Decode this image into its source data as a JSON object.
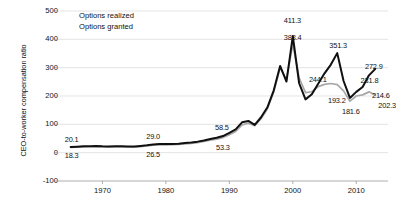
{
  "chart_data": {
    "type": "line",
    "title": "",
    "xlabel": "",
    "ylabel": "CEO-to-worker compensation ratio",
    "xlim": [
      1963,
      2015
    ],
    "ylim": [
      -100,
      500
    ],
    "ytick_labels": [
      "500",
      "400",
      "300",
      "200",
      "100",
      "0",
      "-100"
    ],
    "ytick_values": [
      500,
      400,
      300,
      200,
      100,
      0,
      -100
    ],
    "xtick_labels": [
      "1970",
      "1980",
      "1990",
      "2000",
      "2010"
    ],
    "xtick_values": [
      1970,
      1980,
      1990,
      2000,
      2010
    ],
    "grid": true,
    "legend_position": "top-left",
    "series": [
      {
        "name": "Options realized",
        "color": "#101010",
        "x": [
          1965,
          1966,
          1967,
          1968,
          1969,
          1970,
          1971,
          1972,
          1973,
          1974,
          1975,
          1976,
          1977,
          1978,
          1979,
          1980,
          1981,
          1982,
          1983,
          1984,
          1985,
          1986,
          1987,
          1988,
          1989,
          1990,
          1991,
          1992,
          1993,
          1994,
          1995,
          1996,
          1997,
          1998,
          1999,
          2000,
          2001,
          2002,
          2003,
          2004,
          2005,
          2006,
          2007,
          2008,
          2009,
          2010,
          2011,
          2012,
          2013
        ],
        "values": [
          20.1,
          21.2,
          22.4,
          23.0,
          23.6,
          22.5,
          22.1,
          22.4,
          22.9,
          22.1,
          21.6,
          23.8,
          26.1,
          29.0,
          30.8,
          30.2,
          30.8,
          31.5,
          33.8,
          36.1,
          38.9,
          43.2,
          48.4,
          52.5,
          58.5,
          69.8,
          82.0,
          107.0,
          112.0,
          98.0,
          125.0,
          160.0,
          220.0,
          306.0,
          251.0,
          411.3,
          245.0,
          188.0,
          206.0,
          243.0,
          280.0,
          311.0,
          351.3,
          253.0,
          193.2,
          214.6,
          231.8,
          272.9,
          295.9
        ],
        "labeled_points": [
          {
            "x": 1965,
            "y": 20.1,
            "label": "20.1"
          },
          {
            "x": 1978,
            "y": 29.0,
            "label": "29.0"
          },
          {
            "x": 1989,
            "y": 58.5,
            "label": "58.5"
          },
          {
            "x": 2000,
            "y": 411.3,
            "label": "411.3"
          },
          {
            "x": 2007,
            "y": 351.3,
            "label": "351.3"
          },
          {
            "x": 2009,
            "y": 193.2,
            "label": "193.2"
          },
          {
            "x": 2011,
            "y": 231.8,
            "label": "231.8"
          },
          {
            "x": 2012,
            "y": 272.9,
            "label": "272.9"
          }
        ]
      },
      {
        "name": "Options granted",
        "color": "#a8a8a8",
        "x": [
          1965,
          1966,
          1967,
          1968,
          1969,
          1970,
          1971,
          1972,
          1973,
          1974,
          1975,
          1976,
          1977,
          1978,
          1979,
          1980,
          1981,
          1982,
          1983,
          1984,
          1985,
          1986,
          1987,
          1988,
          1989,
          1990,
          1991,
          1992,
          1993,
          1994,
          1995,
          1996,
          1997,
          1998,
          1999,
          2000,
          2001,
          2002,
          2003,
          2004,
          2005,
          2006,
          2007,
          2008,
          2009,
          2010,
          2011,
          2012,
          2013
        ],
        "values": [
          18.3,
          19.2,
          20.2,
          20.8,
          21.3,
          20.4,
          20.0,
          20.3,
          20.7,
          20.0,
          19.6,
          21.6,
          23.7,
          26.5,
          28.1,
          27.6,
          28.2,
          28.8,
          30.9,
          33.0,
          35.6,
          39.5,
          44.2,
          48.0,
          53.3,
          63.7,
          75.0,
          98.0,
          104.0,
          95.0,
          120.0,
          155.0,
          215.0,
          300.0,
          258.0,
          383.4,
          264.0,
          212.0,
          215.0,
          233.0,
          241.0,
          244.1,
          240.0,
          218.0,
          181.6,
          200.0,
          204.0,
          214.6,
          202.3
        ],
        "labeled_points": [
          {
            "x": 1965,
            "y": 18.3,
            "label": "18.3"
          },
          {
            "x": 1978,
            "y": 26.5,
            "label": "26.5"
          },
          {
            "x": 1989,
            "y": 53.3,
            "label": "53.3"
          },
          {
            "x": 2000,
            "y": 383.4,
            "label": "383.4"
          },
          {
            "x": 2006,
            "y": 244.1,
            "label": "244.1"
          },
          {
            "x": 2009,
            "y": 181.6,
            "label": "181.6"
          },
          {
            "x": 2012,
            "y": 214.6,
            "label": "214.6"
          },
          {
            "x": 2013,
            "y": 202.3,
            "label": "202.3"
          }
        ]
      }
    ]
  },
  "legend": {
    "items": [
      {
        "label": "Options realized",
        "color": "#101010"
      },
      {
        "label": "Options granted",
        "color": "#a8a8a8"
      }
    ]
  },
  "axis": {
    "y_title": "CEO-to-worker compensation ratio"
  },
  "colors": {
    "realized": "#101010",
    "granted": "#a8a8a8",
    "grid": "#d8d8d8",
    "axis": "#9a9a9a",
    "text": "#111111"
  }
}
